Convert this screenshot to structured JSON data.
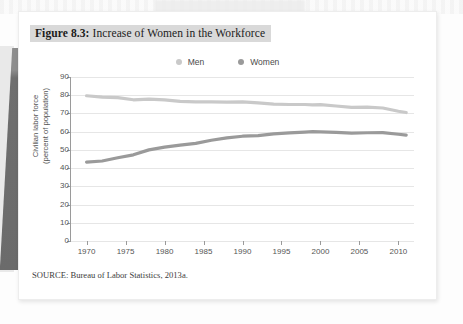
{
  "figure": {
    "caption_number": "Figure 8.3:",
    "caption_text": " Increase of Women in the Workforce",
    "source_note": "SOURCE: Bureau of Labor Statistics, 2013a."
  },
  "colors": {
    "men_line": "#c9c9c9",
    "women_line": "#9a9a9a",
    "gridline": "#e6e6e6",
    "axis": "#9a9a9a",
    "caption_highlight": "#d9d9d9",
    "page": "#ffffff",
    "binding_shadow": "#6f6f6f"
  },
  "chart_data": {
    "type": "line",
    "title": "Figure 8.3: Increase of Women in the Workforce",
    "xlabel": "",
    "ylabel": "Civilian labor force\n(percent of population)",
    "ylabel_line1": "Civilian labor force",
    "ylabel_line2": "(percent of population)",
    "xlim": [
      1968,
      2012
    ],
    "ylim": [
      0,
      90
    ],
    "ytick_labels": [
      "90",
      "80",
      "70",
      "60",
      "50",
      "40",
      "30",
      "20",
      "10",
      "0"
    ],
    "yticks": [
      90,
      80,
      70,
      60,
      50,
      40,
      30,
      20,
      10,
      0
    ],
    "xticks": [
      1970,
      1975,
      1980,
      1985,
      1990,
      1995,
      2000,
      2005,
      2010
    ],
    "xtick_labels": [
      "1970",
      "1975",
      "1980",
      "1985",
      "1990",
      "1995",
      "2000",
      "2005",
      "2010"
    ],
    "grid": true,
    "legend_position": "top-center",
    "x": [
      1970,
      1972,
      1974,
      1976,
      1978,
      1980,
      1982,
      1984,
      1986,
      1988,
      1990,
      1992,
      1994,
      1996,
      1998,
      1999,
      2000,
      2002,
      2004,
      2006,
      2008,
      2010,
      2011
    ],
    "series": [
      {
        "name": "Men",
        "color": "#c9c9c9",
        "values": [
          79.7,
          79.0,
          78.7,
          77.5,
          77.9,
          77.4,
          76.6,
          76.4,
          76.3,
          76.2,
          76.4,
          75.8,
          75.1,
          74.9,
          74.9,
          74.7,
          74.8,
          74.1,
          73.3,
          73.5,
          73.0,
          71.2,
          70.5
        ]
      },
      {
        "name": "Women",
        "color": "#9a9a9a",
        "values": [
          43.3,
          43.9,
          45.7,
          47.3,
          50.0,
          51.5,
          52.6,
          53.6,
          55.3,
          56.6,
          57.5,
          57.8,
          58.8,
          59.3,
          59.8,
          60.0,
          59.9,
          59.6,
          59.2,
          59.4,
          59.5,
          58.6,
          58.1
        ]
      }
    ]
  },
  "legend": {
    "items": [
      {
        "label": "Men",
        "color": "#c9c9c9"
      },
      {
        "label": "Women",
        "color": "#9a9a9a"
      }
    ]
  }
}
